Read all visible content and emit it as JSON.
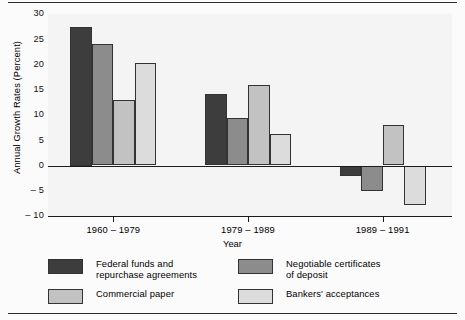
{
  "chart_data": {
    "type": "bar",
    "title": "",
    "xlabel": "Year",
    "ylabel": "Annual Growth Rates (Percent)",
    "categories": [
      "1960 – 1979",
      "1979 – 1989",
      "1989 – 1991"
    ],
    "ylim": [
      -10,
      30
    ],
    "yticks": [
      30,
      25,
      20,
      15,
      10,
      5,
      0,
      "– 5",
      "– 10"
    ],
    "ytick_values": [
      30,
      25,
      20,
      15,
      10,
      5,
      0,
      -5,
      -10
    ],
    "grid": false,
    "legend_position": "bottom",
    "series": [
      {
        "name": "Federal funds and\nrepurchase agreements",
        "color": "#3d3d3d",
        "values": [
          27.5,
          14.1,
          -2.0
        ]
      },
      {
        "name": "Negotiable certificates\nof deposit",
        "color": "#8c8c8c",
        "values": [
          24.0,
          9.4,
          -5.0
        ]
      },
      {
        "name": "Commercial paper",
        "color": "#c2c2c2",
        "values": [
          13.0,
          16.0,
          8.0
        ]
      },
      {
        "name": "Bankers' acceptances",
        "color": "#dcdcdc",
        "values": [
          20.2,
          6.3,
          -7.8
        ]
      }
    ]
  },
  "colors": {
    "plot_background": "#f4f4f4",
    "axis": "#1a1a1a",
    "bar_edge": "#333333",
    "rule": "#2a2a2a"
  }
}
